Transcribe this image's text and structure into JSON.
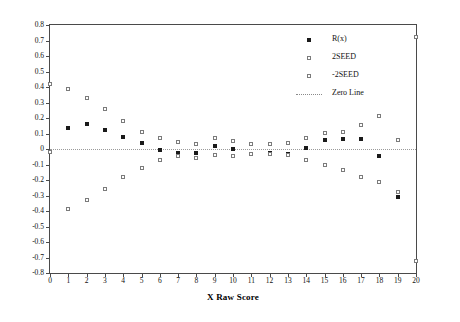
{
  "chart_data": {
    "type": "scatter",
    "title": "",
    "xlabel": "X Raw Score",
    "ylabel": "R = eᵧ(x) - Linear and +/- 2SEED",
    "xlim": [
      0,
      20
    ],
    "ylim": [
      -0.8,
      0.8
    ],
    "xticks": [
      "0",
      "1",
      "2",
      "3",
      "4",
      "5",
      "6",
      "7",
      "8",
      "9",
      "10",
      "11",
      "12",
      "13",
      "14",
      "15",
      "16",
      "17",
      "18",
      "19",
      "20"
    ],
    "yticks": [
      "0.8",
      "0.7",
      "0.6",
      "0.5",
      "0.4",
      "0.3",
      "0.2",
      "0.1",
      "0",
      "-0.1",
      "-0.2",
      "-0.3",
      "-0.4",
      "-0.5",
      "-0.6",
      "-0.7",
      "-0.8"
    ],
    "grid": false,
    "legend_position": "top-right",
    "zero_line_value": 0,
    "x": [
      0,
      1,
      2,
      3,
      4,
      5,
      6,
      7,
      8,
      9,
      10,
      11,
      12,
      13,
      14,
      15,
      16,
      17,
      18,
      19,
      20
    ],
    "series": [
      {
        "name": "R(x)",
        "marker": "filled-square",
        "color": "#1a1a1a",
        "values": [
          -0.02,
          0.133,
          0.159,
          0.123,
          0.079,
          0.037,
          -0.004,
          -0.028,
          -0.026,
          0.022,
          0.0,
          -0.031,
          -0.029,
          -0.033,
          0.004,
          0.056,
          0.062,
          0.066,
          -0.046,
          -0.31,
          -0.72
        ]
      },
      {
        "name": "2SEED",
        "marker": "open-square",
        "color": "#7b7b7b",
        "values": [
          0.42,
          0.385,
          0.328,
          0.256,
          0.182,
          0.111,
          0.072,
          0.047,
          0.035,
          0.071,
          0.054,
          0.034,
          0.031,
          0.038,
          0.068,
          0.104,
          0.108,
          0.152,
          0.213,
          0.06,
          0.72
        ]
      },
      {
        "name": "-2SEED",
        "marker": "open-square",
        "color": "#7b7b7b",
        "values": [
          -0.02,
          -0.385,
          -0.328,
          -0.256,
          -0.182,
          -0.121,
          -0.072,
          -0.047,
          -0.057,
          -0.036,
          -0.044,
          -0.034,
          -0.031,
          -0.038,
          -0.068,
          -0.104,
          -0.135,
          -0.178,
          -0.213,
          -0.28,
          -0.72
        ]
      }
    ],
    "legend": [
      {
        "label": "R(x)",
        "marker": "filled-square"
      },
      {
        "label": "2SEED",
        "marker": "open-square"
      },
      {
        "label": "-2SEED",
        "marker": "open-square"
      },
      {
        "label": "Zero Line",
        "marker": "dotted-line"
      }
    ]
  }
}
